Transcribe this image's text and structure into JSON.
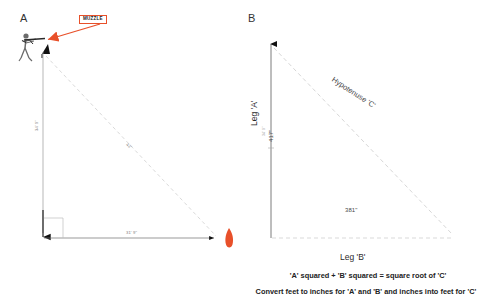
{
  "panels": {
    "a": {
      "letter": "A",
      "muzzle_label": "MUZZLE",
      "vertical_dim": "34' 9\"",
      "diagonal_dim": "42'",
      "horizontal_dim": "31' 9\"",
      "shooter_icon": "standing-shooter-icon",
      "target_icon": "target-marker-icon",
      "accent_color": "#E8502A"
    },
    "b": {
      "letter": "B",
      "leg_a_name": "Leg 'A'",
      "leg_b_name": "Leg 'B'",
      "hypotenuse_name": "Hypotenuse 'C'",
      "leg_a_dim": "417\"",
      "leg_a_dim_small": "34' 9\"",
      "leg_b_dim": "381\"",
      "leg_b_dim_small": "31' 9\""
    }
  },
  "notes": {
    "formula_line_1": "'A' squared + 'B' squared = square root of  'C'",
    "formula_line_2": "Convert feet to inches for 'A' and 'B' and inches into feet for 'C'"
  }
}
